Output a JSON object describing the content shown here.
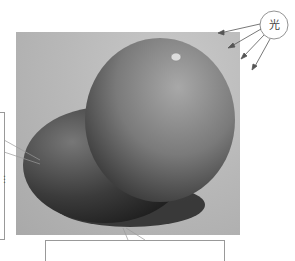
{
  "diagram": {
    "light_source": {
      "label": "光",
      "arrows": 4
    },
    "callouts": {
      "left_box_text": "",
      "left_dots": "⋮",
      "bottom_box_text": ""
    },
    "colors": {
      "background": "#b8b8b8",
      "orange_light": "#9a9a9a",
      "orange_dark": "#2a2a2a",
      "shadow": "#1c1c1c"
    }
  }
}
